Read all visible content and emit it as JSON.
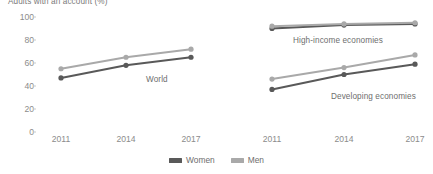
{
  "chart_data": {
    "type": "line",
    "title": "Adults with an account (%)",
    "xlabel": "",
    "ylabel": "",
    "ylim": [
      0,
      100
    ],
    "ytick_values": [
      0,
      20,
      40,
      60,
      80,
      100
    ],
    "ytick_labels": [
      "0",
      "20",
      "40",
      "60",
      "80",
      "100"
    ],
    "x": [
      2011,
      2014,
      2017
    ],
    "xtick_labels": [
      "2011",
      "2014",
      "2017"
    ],
    "grid": false,
    "legend_position": "bottom-center",
    "legend": [
      {
        "name": "Women",
        "color": "#595959"
      },
      {
        "name": "Men",
        "color": "#a9a9a9"
      }
    ],
    "panels": [
      {
        "key": "world",
        "label": "World",
        "series": [
          {
            "name": "Women",
            "color": "#595959",
            "values": [
              47,
              58,
              65
            ]
          },
          {
            "name": "Men",
            "color": "#a9a9a9",
            "values": [
              55,
              65,
              72
            ]
          }
        ]
      },
      {
        "key": "high_income",
        "label": "High-income economies",
        "series": [
          {
            "name": "Women",
            "color": "#595959",
            "values": [
              90,
              93,
              94
            ]
          },
          {
            "name": "Men",
            "color": "#a9a9a9",
            "values": [
              92,
              94,
              95
            ]
          }
        ]
      },
      {
        "key": "developing",
        "label": "Developing economies",
        "series": [
          {
            "name": "Women",
            "color": "#595959",
            "values": [
              37,
              50,
              59
            ]
          },
          {
            "name": "Men",
            "color": "#a9a9a9",
            "values": [
              46,
              56,
              67
            ]
          }
        ]
      }
    ]
  },
  "colors": {
    "women": "#595959",
    "men": "#a9a9a9",
    "axis_text": "#8c8c8c",
    "label_text": "#6e6e6e",
    "background": "#ffffff"
  }
}
